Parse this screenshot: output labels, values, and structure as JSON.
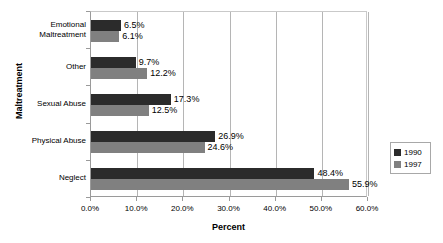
{
  "chart_data": {
    "type": "bar",
    "orientation": "horizontal",
    "title": "",
    "xlabel": "Percent",
    "ylabel": "Maltreatment",
    "xlim": [
      0,
      60
    ],
    "grid": true,
    "legend_position": "right",
    "categories": [
      "Neglect",
      "Physical Abuse",
      "Sexual Abuse",
      "Other",
      "Emotional Maltreatment"
    ],
    "category_label_lines": [
      [
        "Neglect"
      ],
      [
        "Physical Abuse"
      ],
      [
        "Sexual Abuse"
      ],
      [
        "Other"
      ],
      [
        "Emotional",
        "Maltreatment"
      ]
    ],
    "series": [
      {
        "name": "1990",
        "color": "#2b2b2b",
        "values": [
          48.4,
          26.9,
          17.3,
          9.7,
          6.5
        ],
        "labels": [
          "48.4%",
          "26.9%",
          "17.3%",
          "9.7%",
          "6.5%"
        ]
      },
      {
        "name": "1997",
        "color": "#808080",
        "values": [
          55.9,
          24.6,
          12.5,
          12.2,
          6.1
        ],
        "labels": [
          "55.9%",
          "24.6%",
          "12.5%",
          "12.2%",
          "6.1%"
        ]
      }
    ],
    "xticks": [
      0,
      10,
      20,
      30,
      40,
      50,
      60
    ],
    "xtick_labels": [
      "0.0%",
      "10.0%",
      "20.0%",
      "30.0%",
      "40.0%",
      "50.0%",
      "60.0%"
    ]
  },
  "legend": {
    "entries": [
      {
        "label": "1990",
        "color": "#2b2b2b"
      },
      {
        "label": "1997",
        "color": "#808080"
      }
    ]
  },
  "colors": {
    "series_1990": "#2b2b2b",
    "series_1997": "#808080",
    "gridline": "#b5b5b5",
    "axis": "#9a9a9a",
    "background": "#ffffff"
  }
}
